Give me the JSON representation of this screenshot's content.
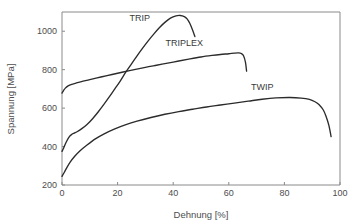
{
  "chart_data": {
    "type": "line",
    "title": "",
    "xlabel": "Dehnung [%]",
    "ylabel": "Spannung [MPa]",
    "xlim": [
      0,
      100
    ],
    "ylim": [
      200,
      1100
    ],
    "xticks": [
      0,
      20,
      40,
      60,
      80,
      100
    ],
    "yticks": [
      200,
      400,
      600,
      800,
      1000
    ],
    "xticklabels": [
      "0",
      "20",
      "40",
      "60",
      "80",
      "100"
    ],
    "yticklabels": [
      "200",
      "400",
      "600",
      "800",
      "1000"
    ],
    "grid": false,
    "legend_position": "inline-annotations",
    "series": [
      {
        "name": "TRIP",
        "label": "TRIP",
        "label_x": 28,
        "label_y": 1055,
        "color": "#2b2b2b",
        "x": [
          0,
          0.6,
          1.4,
          2.4,
          3.4,
          4.4,
          5.4,
          7,
          9,
          11,
          13,
          15,
          17,
          19,
          21,
          23,
          25,
          27,
          29,
          31,
          33,
          35,
          37,
          39,
          41,
          42.5,
          44,
          45,
          46,
          47,
          47.8
        ],
        "y": [
          375,
          392,
          420,
          447,
          462,
          470,
          477,
          492,
          515,
          545,
          580,
          618,
          658,
          700,
          742,
          788,
          830,
          872,
          912,
          950,
          985,
          1018,
          1046,
          1068,
          1080,
          1082,
          1076,
          1064,
          1040,
          1005,
          972
        ]
      },
      {
        "name": "TRIPLEX",
        "label": "TRIPLEX",
        "label_x": 44,
        "label_y": 925,
        "color": "#2b2b2b",
        "x": [
          0,
          0.5,
          1.2,
          2.2,
          3.5,
          5,
          7,
          10,
          14,
          18,
          22,
          26,
          30,
          34,
          38,
          42,
          46,
          50,
          54,
          57,
          60,
          62,
          63.5,
          64.5,
          65.3,
          66,
          66.4
        ],
        "y": [
          678,
          690,
          704,
          716,
          724,
          730,
          738,
          748,
          762,
          775,
          788,
          800,
          812,
          823,
          834,
          845,
          856,
          866,
          874,
          879,
          883,
          886,
          887,
          884,
          872,
          838,
          792
        ]
      },
      {
        "name": "TWIP",
        "label": "TWIP",
        "label_x": 72,
        "label_y": 695,
        "color": "#2b2b2b",
        "x": [
          0,
          0.8,
          1.8,
          3,
          4.5,
          6.5,
          9,
          12,
          15,
          19,
          23,
          27,
          32,
          37,
          42,
          47,
          52,
          57,
          62,
          67,
          72,
          77,
          82,
          86,
          89,
          91,
          92.5,
          94,
          95,
          96,
          96.8
        ],
        "y": [
          245,
          265,
          292,
          320,
          348,
          378,
          408,
          440,
          465,
          492,
          514,
          532,
          551,
          568,
          582,
          594,
          606,
          616,
          626,
          636,
          646,
          653,
          655,
          652,
          645,
          633,
          618,
          590,
          556,
          510,
          452
        ]
      }
    ]
  },
  "figure": {
    "background_color": "#ffffff",
    "axis_color": "#8a8a8a",
    "curve_color": "#2b2b2b"
  }
}
